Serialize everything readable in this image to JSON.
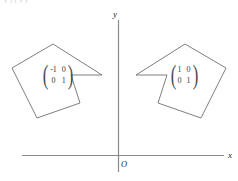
{
  "figure": {
    "title_fragment": "y ) ( y )",
    "axes": {
      "x_label": "x",
      "y_label": "y",
      "origin_label": "O",
      "color": "#8a8a8a"
    },
    "shapes": [
      {
        "name": "reflected-polygon",
        "stroke": "#6f6f6f",
        "fill": "none",
        "points": "12,68 53,44 102,75 71,75 80,103 37,118"
      },
      {
        "name": "original-polygon",
        "stroke": "#6f6f6f",
        "fill": "none",
        "points": "226,68 185,44 136,75 167,75 158,103 201,118"
      }
    ],
    "matrices": [
      {
        "name": "reflection-matrix",
        "rows": [
          [
            "-1",
            "0"
          ],
          [
            "0",
            "1"
          ]
        ]
      },
      {
        "name": "identity-matrix",
        "rows": [
          [
            "1",
            "0"
          ],
          [
            "0",
            "1"
          ]
        ]
      }
    ]
  }
}
